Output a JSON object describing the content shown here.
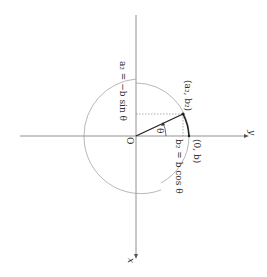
{
  "figure": {
    "orientation": "rotated 90 degrees clockwise",
    "axes": {
      "horizontal_label": "y",
      "vertical_label": "x"
    },
    "origin_label": "O",
    "angle_label": "θ",
    "points": {
      "rotated_point": "(a₂, b₂)",
      "start_point": "(0, b)"
    },
    "equations": {
      "a2": "a₂ = −b sin θ",
      "b2": "b₂ = b cos θ"
    },
    "colors": {
      "line": "#555555",
      "vector": "#222222",
      "circle": "#888888",
      "text": "#333333"
    }
  }
}
